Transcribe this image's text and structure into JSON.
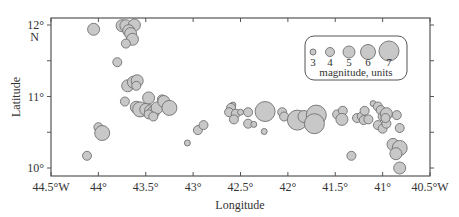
{
  "chart_data": {
    "type": "scatter",
    "title": "",
    "xlabel": "Longitude",
    "ylabel": "Latitude",
    "xlim": [
      -44.5,
      -40.5
    ],
    "ylim": [
      9.9,
      12.1
    ],
    "x_ticks": [
      {
        "value": -44.5,
        "label": "44.5°W"
      },
      {
        "value": -44.0,
        "label": "44°"
      },
      {
        "value": -43.5,
        "label": "43.5°"
      },
      {
        "value": -43.0,
        "label": "43°"
      },
      {
        "value": -42.5,
        "label": "42.5°"
      },
      {
        "value": -42.0,
        "label": "42°"
      },
      {
        "value": -41.5,
        "label": "41.5°"
      },
      {
        "value": -41.0,
        "label": "41°"
      },
      {
        "value": -40.5,
        "label": "40.5°W"
      }
    ],
    "y_ticks": [
      {
        "value": 12.0,
        "label": "12°",
        "sublabel": "N"
      },
      {
        "value": 11.5,
        "label": ""
      },
      {
        "value": 11.0,
        "label": "11°"
      },
      {
        "value": 10.5,
        "label": ""
      },
      {
        "value": 10.0,
        "label": "10°"
      }
    ],
    "grid": false,
    "legend": {
      "title": "magnitude, units",
      "position": "upper right",
      "entries": [
        {
          "label": "3",
          "magnitude": 3
        },
        {
          "label": "4",
          "magnitude": 4
        },
        {
          "label": "5",
          "magnitude": 5
        },
        {
          "label": "6",
          "magnitude": 6
        },
        {
          "label": "7",
          "magnitude": 7
        }
      ]
    },
    "marker_color": "#c8c8c8",
    "marker_edge_color": "#707070",
    "points": [
      {
        "lon": -44.05,
        "lat": 11.94,
        "mag": 5
      },
      {
        "lon": -43.75,
        "lat": 11.99,
        "mag": 5
      },
      {
        "lon": -43.71,
        "lat": 11.99,
        "mag": 5
      },
      {
        "lon": -43.62,
        "lat": 12.0,
        "mag": 5
      },
      {
        "lon": -43.68,
        "lat": 11.92,
        "mag": 5
      },
      {
        "lon": -43.66,
        "lat": 11.88,
        "mag": 5
      },
      {
        "lon": -43.64,
        "lat": 11.8,
        "mag": 5
      },
      {
        "lon": -43.71,
        "lat": 11.74,
        "mag": 4
      },
      {
        "lon": -43.8,
        "lat": 11.48,
        "mag": 4
      },
      {
        "lon": -43.69,
        "lat": 11.15,
        "mag": 5
      },
      {
        "lon": -43.63,
        "lat": 11.2,
        "mag": 5
      },
      {
        "lon": -43.59,
        "lat": 11.22,
        "mag": 5
      },
      {
        "lon": -43.6,
        "lat": 11.15,
        "mag": 4
      },
      {
        "lon": -43.72,
        "lat": 10.93,
        "mag": 4
      },
      {
        "lon": -43.6,
        "lat": 10.85,
        "mag": 5
      },
      {
        "lon": -43.56,
        "lat": 10.82,
        "mag": 6
      },
      {
        "lon": -43.5,
        "lat": 10.82,
        "mag": 5
      },
      {
        "lon": -43.45,
        "lat": 10.8,
        "mag": 5
      },
      {
        "lon": -43.42,
        "lat": 10.78,
        "mag": 5
      },
      {
        "lon": -43.47,
        "lat": 10.98,
        "mag": 5
      },
      {
        "lon": -43.38,
        "lat": 10.84,
        "mag": 5
      },
      {
        "lon": -43.33,
        "lat": 10.96,
        "mag": 4
      },
      {
        "lon": -43.31,
        "lat": 10.93,
        "mag": 5
      },
      {
        "lon": -43.25,
        "lat": 10.84,
        "mag": 6
      },
      {
        "lon": -43.47,
        "lat": 10.75,
        "mag": 4
      },
      {
        "lon": -43.42,
        "lat": 10.72,
        "mag": 4
      },
      {
        "lon": -44.0,
        "lat": 10.57,
        "mag": 4
      },
      {
        "lon": -43.96,
        "lat": 10.49,
        "mag": 6
      },
      {
        "lon": -44.12,
        "lat": 10.17,
        "mag": 4
      },
      {
        "lon": -43.06,
        "lat": 10.35,
        "mag": 3
      },
      {
        "lon": -42.95,
        "lat": 10.53,
        "mag": 4
      },
      {
        "lon": -42.89,
        "lat": 10.6,
        "mag": 4
      },
      {
        "lon": -42.58,
        "lat": 10.88,
        "mag": 3
      },
      {
        "lon": -42.6,
        "lat": 10.84,
        "mag": 4
      },
      {
        "lon": -42.62,
        "lat": 10.78,
        "mag": 4
      },
      {
        "lon": -42.55,
        "lat": 10.76,
        "mag": 4
      },
      {
        "lon": -42.57,
        "lat": 10.68,
        "mag": 4
      },
      {
        "lon": -42.5,
        "lat": 10.78,
        "mag": 3
      },
      {
        "lon": -42.42,
        "lat": 10.78,
        "mag": 4
      },
      {
        "lon": -42.42,
        "lat": 10.62,
        "mag": 4
      },
      {
        "lon": -42.24,
        "lat": 10.79,
        "mag": 7
      },
      {
        "lon": -42.36,
        "lat": 10.61,
        "mag": 3
      },
      {
        "lon": -42.25,
        "lat": 10.51,
        "mag": 3
      },
      {
        "lon": -42.06,
        "lat": 10.78,
        "mag": 4
      },
      {
        "lon": -42.04,
        "lat": 10.72,
        "mag": 4
      },
      {
        "lon": -41.9,
        "lat": 10.67,
        "mag": 7
      },
      {
        "lon": -41.83,
        "lat": 10.72,
        "mag": 5
      },
      {
        "lon": -41.7,
        "lat": 10.74,
        "mag": 7
      },
      {
        "lon": -41.72,
        "lat": 10.62,
        "mag": 7
      },
      {
        "lon": -41.48,
        "lat": 10.75,
        "mag": 4
      },
      {
        "lon": -41.42,
        "lat": 10.8,
        "mag": 4
      },
      {
        "lon": -41.43,
        "lat": 10.68,
        "mag": 5
      },
      {
        "lon": -41.27,
        "lat": 10.7,
        "mag": 4
      },
      {
        "lon": -41.22,
        "lat": 10.72,
        "mag": 4
      },
      {
        "lon": -41.19,
        "lat": 10.8,
        "mag": 4
      },
      {
        "lon": -41.2,
        "lat": 10.67,
        "mag": 4
      },
      {
        "lon": -41.15,
        "lat": 10.68,
        "mag": 4
      },
      {
        "lon": -41.1,
        "lat": 10.9,
        "mag": 3
      },
      {
        "lon": -41.05,
        "lat": 10.86,
        "mag": 4
      },
      {
        "lon": -41.02,
        "lat": 10.81,
        "mag": 4
      },
      {
        "lon": -41.0,
        "lat": 10.72,
        "mag": 4
      },
      {
        "lon": -40.96,
        "lat": 10.76,
        "mag": 5
      },
      {
        "lon": -41.05,
        "lat": 10.6,
        "mag": 4
      },
      {
        "lon": -41.0,
        "lat": 10.55,
        "mag": 4
      },
      {
        "lon": -40.96,
        "lat": 10.62,
        "mag": 4
      },
      {
        "lon": -40.97,
        "lat": 10.7,
        "mag": 4
      },
      {
        "lon": -40.85,
        "lat": 10.74,
        "mag": 4
      },
      {
        "lon": -40.82,
        "lat": 10.56,
        "mag": 4
      },
      {
        "lon": -41.33,
        "lat": 10.17,
        "mag": 4
      },
      {
        "lon": -40.89,
        "lat": 10.33,
        "mag": 5
      },
      {
        "lon": -40.82,
        "lat": 10.28,
        "mag": 6
      },
      {
        "lon": -40.86,
        "lat": 10.2,
        "mag": 5
      },
      {
        "lon": -40.82,
        "lat": 10.0,
        "mag": 5
      }
    ]
  },
  "layout": {
    "plot_left": 51,
    "plot_right": 430,
    "plot_top": 18,
    "plot_bottom": 176,
    "y_at_12": 25,
    "y_at_10": 168
  }
}
